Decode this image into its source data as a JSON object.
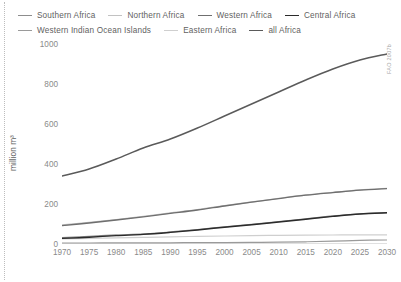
{
  "figure": {
    "source_note": "FAO 2007b",
    "background": "#ffffff"
  },
  "legend": {
    "rows": [
      [
        {
          "label": "Southern Africa",
          "color": "#8d8d8d",
          "key": "southern_africa"
        },
        {
          "label": "Northern Africa",
          "color": "#c2c2c2",
          "key": "northern_africa"
        },
        {
          "label": "Western Africa",
          "color": "#6f6f6f",
          "key": "western_africa"
        },
        {
          "label": "Central Africa",
          "color": "#2b2b2b",
          "key": "central_africa"
        }
      ],
      [
        {
          "label": "Western Indian Ocean Islands",
          "color": "#9a9a9a",
          "key": "wio_islands"
        },
        {
          "label": "Eastern Africa",
          "color": "#cfcfcf",
          "key": "eastern_africa"
        },
        {
          "label": "all Africa",
          "color": "#5a5a5a",
          "key": "all_africa"
        }
      ]
    ]
  },
  "axes": {
    "y_title": "million m³",
    "y_ticks": [
      "0",
      "200",
      "400",
      "600",
      "800",
      "1000"
    ],
    "x_ticks": [
      "1970",
      "1975",
      "1980",
      "1985",
      "1990",
      "1995",
      "2000",
      "2005",
      "2010",
      "2015",
      "2020",
      "2025",
      "2030"
    ]
  },
  "chart_data": {
    "type": "line",
    "title": "",
    "xlabel": "",
    "ylabel": "million m³",
    "xlim": [
      1970,
      2030
    ],
    "ylim": [
      0,
      1000
    ],
    "grid": false,
    "legend_position": "top",
    "x": [
      1970,
      1975,
      1980,
      1985,
      1990,
      1995,
      2000,
      2005,
      2010,
      2015,
      2020,
      2025,
      2030
    ],
    "series": [
      {
        "name": "all Africa",
        "color": "#5a5a5a",
        "width": 1.5,
        "values": [
          340,
          375,
          425,
          480,
          525,
          580,
          640,
          700,
          760,
          820,
          875,
          920,
          950
        ]
      },
      {
        "name": "Northern Africa",
        "color": "#c2c2c2",
        "width": 1.3,
        "values": [
          95,
          108,
          122,
          138,
          155,
          172,
          192,
          210,
          228,
          245,
          258,
          270,
          278
        ]
      },
      {
        "name": "Western Africa",
        "color": "#6f6f6f",
        "width": 1.3,
        "values": [
          92,
          105,
          120,
          136,
          153,
          170,
          190,
          209,
          227,
          244,
          257,
          269,
          277
        ]
      },
      {
        "name": "Central Africa",
        "color": "#2b2b2b",
        "width": 1.4,
        "values": [
          28,
          34,
          42,
          48,
          58,
          70,
          84,
          96,
          110,
          124,
          138,
          150,
          156
        ]
      },
      {
        "name": "Southern Africa",
        "color": "#8d8d8d",
        "width": 1.3,
        "values": [
          32,
          38,
          45,
          50,
          60,
          72,
          86,
          98,
          112,
          126,
          140,
          151,
          157
        ]
      },
      {
        "name": "Eastern Africa",
        "color": "#cfcfcf",
        "width": 1.2,
        "values": [
          26,
          28,
          31,
          33,
          36,
          38,
          40,
          42,
          43,
          44,
          45,
          46,
          46
        ]
      },
      {
        "name": "Western Indian Ocean Islands",
        "color": "#9a9a9a",
        "width": 1.2,
        "values": [
          5,
          5,
          6,
          6,
          6,
          7,
          7,
          8,
          9,
          11,
          14,
          18,
          20
        ]
      }
    ]
  }
}
